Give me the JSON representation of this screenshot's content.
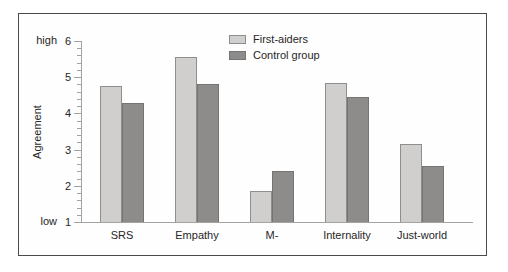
{
  "chart_data": {
    "type": "bar",
    "title": "",
    "ylabel": "Agreement",
    "xlabel": "",
    "categories": [
      "SRS",
      "Empathy",
      "M-",
      "Internality",
      "Just-world"
    ],
    "series": [
      {
        "name": "First-aiders",
        "color": "#d0cfcd",
        "border_color": "#8e8e8c",
        "values": [
          4.75,
          5.55,
          1.85,
          4.85,
          3.15
        ]
      },
      {
        "name": "Control group",
        "color": "#8d8c8a",
        "border_color": "#757472",
        "values": [
          4.3,
          4.8,
          2.4,
          4.45,
          2.55
        ]
      }
    ],
    "y_axis": {
      "min": 1,
      "max": 6,
      "major_step": 1,
      "minor_step": 0.2,
      "top_label": "high",
      "bottom_label": "low",
      "tick_labels": [
        "1",
        "2",
        "3",
        "4",
        "5",
        "6"
      ]
    },
    "grid": false,
    "legend_position": "top-center-inside"
  }
}
